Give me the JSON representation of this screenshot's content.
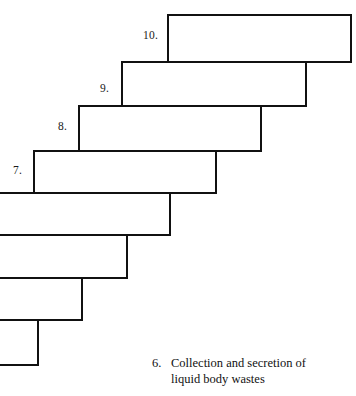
{
  "diagram": {
    "type": "staircase-step-diagram",
    "stroke_color": "#111111",
    "fill_color": "#ffffff",
    "stroke_width": 2,
    "canvas": {
      "width": 356,
      "height": 396
    },
    "steps": [
      {
        "id": "step-10",
        "label": "10.",
        "label_x": 143,
        "label_y": 33,
        "box": {
          "x": 168,
          "y": 15,
          "w": 183,
          "h": 47
        }
      },
      {
        "id": "step-9",
        "label": "9.",
        "label_x": 100,
        "label_y": 84,
        "box": {
          "x": 122,
          "y": 62,
          "w": 184,
          "h": 44
        }
      },
      {
        "id": "step-8",
        "label": "8.",
        "label_x": 58,
        "label_y": 121,
        "box": {
          "x": 79,
          "y": 106,
          "w": 182,
          "h": 45
        }
      },
      {
        "id": "step-7",
        "label": "7.",
        "label_x": 13,
        "label_y": 165,
        "box": {
          "x": 34,
          "y": 151,
          "w": 182,
          "h": 42
        }
      },
      {
        "id": "step-6",
        "label": "",
        "label_x": 0,
        "label_y": 0,
        "box": {
          "x": -12,
          "y": 193,
          "w": 182,
          "h": 42
        }
      },
      {
        "id": "step-5",
        "label": "",
        "label_x": 0,
        "label_y": 0,
        "box": {
          "x": -55,
          "y": 235,
          "w": 182,
          "h": 43
        }
      },
      {
        "id": "step-4",
        "label": "",
        "label_x": 0,
        "label_y": 0,
        "box": {
          "x": -100,
          "y": 278,
          "w": 182,
          "h": 42
        }
      },
      {
        "id": "step-3",
        "label": "",
        "label_x": 0,
        "label_y": 0,
        "box": {
          "x": -144,
          "y": 320,
          "w": 182,
          "h": 45
        }
      }
    ]
  },
  "caption": {
    "number": "6.",
    "line1": "Collection and secretion of",
    "line2": "liquid body wastes",
    "full_text": "6. Collection and secretion of liquid body wastes"
  }
}
